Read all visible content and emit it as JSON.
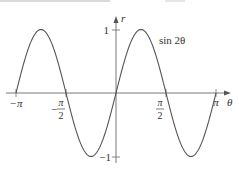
{
  "chart_data": {
    "type": "line",
    "title": "",
    "series": [
      {
        "name": "sin 2θ",
        "function": "r = sin(2θ)",
        "color": "#555555"
      }
    ],
    "x": {
      "min": -3.14159,
      "max": 3.14159
    },
    "xlabel": "θ",
    "ylabel": "r",
    "xlim": [
      -3.3,
      3.5
    ],
    "ylim": [
      -1.1,
      1.2
    ],
    "x_ticks": [
      {
        "value": -3.14159,
        "label": "−π"
      },
      {
        "value": -1.5708,
        "label_num": "π",
        "label_den": "2",
        "sign": "−"
      },
      {
        "value": 1.5708,
        "label_num": "π",
        "label_den": "2",
        "sign": ""
      },
      {
        "value": 3.14159,
        "label": "π"
      }
    ],
    "y_ticks": [
      {
        "value": 1,
        "label": "1"
      },
      {
        "value": -1,
        "label": "−1"
      }
    ],
    "annotations": [
      {
        "text": "sin 2θ",
        "x": 0.95,
        "y": 0.85
      }
    ],
    "grid": false,
    "legend": "none"
  },
  "labels": {
    "curve": "sin 2θ",
    "x_axis": "θ",
    "y_axis": "r",
    "neg_pi": "−π",
    "pi": "π",
    "half_num": "π",
    "half_den": "2",
    "minus": "−",
    "one": "1",
    "neg_one": "−1"
  },
  "colors": {
    "curve": "#555555",
    "axis": "#6a6a6a",
    "text": "#333333"
  }
}
